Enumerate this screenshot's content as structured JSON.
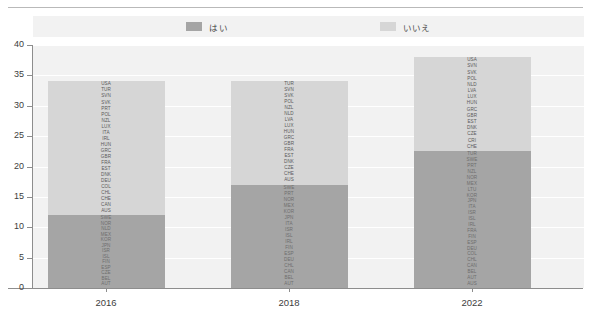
{
  "legend": {
    "items": [
      {
        "label": "はい",
        "color": "#a5a5a5",
        "key": "yes"
      },
      {
        "label": "いいえ",
        "color": "#d6d6d6",
        "key": "no"
      }
    ]
  },
  "axes": {
    "y_ticks": [
      "40",
      "35",
      "30",
      "25",
      "20",
      "15",
      "10",
      "5",
      "0"
    ],
    "x_ticks": [
      "2016",
      "2018",
      "2022"
    ]
  },
  "chart_data": {
    "type": "bar",
    "title": "",
    "xlabel": "",
    "ylabel": "",
    "ylim": [
      0,
      40
    ],
    "ytick_step": 5,
    "grid": true,
    "stacked": true,
    "legend_position": "top",
    "categories": [
      "2016",
      "2018",
      "2022"
    ],
    "series": [
      {
        "name": "はい",
        "color": "#a5a5a5",
        "values": [
          12,
          17,
          22.5
        ]
      },
      {
        "name": "いいえ",
        "color": "#d6d6d6",
        "values": [
          22,
          17,
          15.5
        ]
      }
    ],
    "totals": [
      34,
      34,
      38
    ],
    "point_labels": {
      "2016": {
        "no": [
          "USA",
          "TUR",
          "SVN",
          "SVK",
          "PRT",
          "POL",
          "NZL",
          "LUX",
          "ITA",
          "IRL",
          "HUN",
          "GRC",
          "GBR",
          "FRA",
          "EST",
          "DNK",
          "DEU",
          "COL",
          "CHL",
          "CHE",
          "CAN",
          "AUS"
        ],
        "yes": [
          "SWE",
          "NOR",
          "NLD",
          "MEX",
          "KOR",
          "JPN",
          "ISR",
          "ISL",
          "FIN",
          "ESP",
          "CZE",
          "BEL",
          "AUT"
        ]
      },
      "2018": {
        "no": [
          "TUR",
          "SVN",
          "SVK",
          "POL",
          "NZL",
          "NLD",
          "LVA",
          "LUX",
          "HUN",
          "GRC",
          "GBR",
          "FRA",
          "EST",
          "DNK",
          "CZE",
          "CHE",
          "AUS"
        ],
        "yes": [
          "SWE",
          "PRT",
          "NOR",
          "MEX",
          "KOR",
          "JPN",
          "ITA",
          "ISR",
          "ISL",
          "IRL",
          "FIN",
          "ESP",
          "DEU",
          "CHL",
          "CAN",
          "BEL",
          "AUT"
        ]
      },
      "2022": {
        "no": [
          "USA",
          "SVN",
          "SVK",
          "POL",
          "NLD",
          "LVA",
          "LUX",
          "HUN",
          "GRC",
          "GBR",
          "EST",
          "DNK",
          "CZE",
          "CRI",
          "CHE"
        ],
        "yes": [
          "TUR",
          "SWE",
          "PRT",
          "NZL",
          "NOR",
          "MEX",
          "LTU",
          "KOR",
          "JPN",
          "ITA",
          "ISR",
          "ISL",
          "IRL",
          "FRA",
          "FIN",
          "ESP",
          "DEU",
          "COL",
          "CHL",
          "CAN",
          "BEL",
          "AUT",
          "AUS"
        ]
      }
    }
  }
}
